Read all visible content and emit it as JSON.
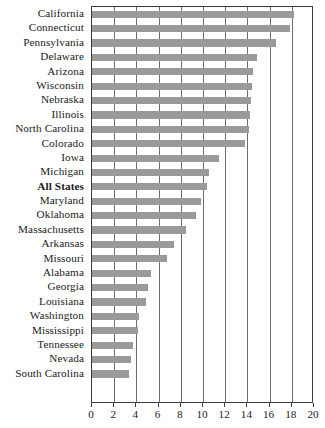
{
  "chart_data": {
    "type": "bar",
    "orientation": "horizontal",
    "title": "",
    "subtitle": "",
    "xlabel": "",
    "ylabel": "",
    "xlim": [
      0,
      20
    ],
    "xticks": [
      0,
      2,
      4,
      6,
      8,
      10,
      12,
      14,
      16,
      18,
      20
    ],
    "grid": true,
    "legend": null,
    "bar_color": "#9a9a9a",
    "highlight_category": "All States",
    "categories": [
      "California",
      "Connecticut",
      "Pennsylvania",
      "Delaware",
      "Arizona",
      "Wisconsin",
      "Nebraska",
      "Illinois",
      "North Carolina",
      "Colorado",
      "Iowa",
      "Michigan",
      "All States",
      "Maryland",
      "Oklahoma",
      "Massachusetts",
      "Arkansas",
      "Missouri",
      "Alabama",
      "Georgia",
      "Louisiana",
      "Washington",
      "Mississippi",
      "Tennessee",
      "Nevada",
      "South Carolina"
    ],
    "values": [
      18.2,
      17.8,
      16.6,
      14.9,
      14.5,
      14.4,
      14.3,
      14.2,
      14.1,
      13.8,
      11.4,
      10.5,
      10.4,
      9.8,
      9.4,
      8.5,
      7.4,
      6.8,
      5.3,
      5.0,
      4.9,
      4.2,
      4.1,
      3.7,
      3.5,
      3.3
    ]
  }
}
